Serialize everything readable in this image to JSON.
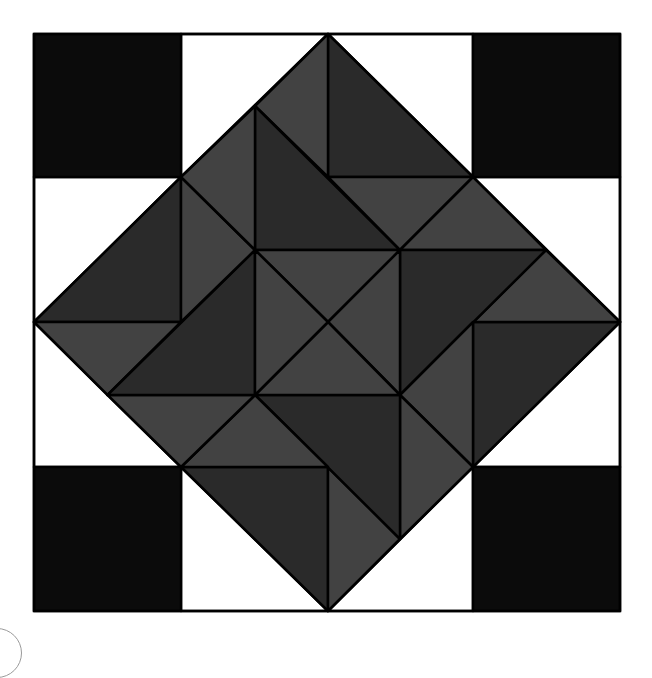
{
  "diagram": {
    "type": "quilt-block",
    "grid": {
      "half_units": 8,
      "x_lines_px": [
        34,
        107.5,
        181,
        255,
        328,
        400,
        473,
        546,
        620
      ],
      "y_lines_px": [
        34,
        106,
        177,
        250,
        322,
        395,
        467,
        539,
        611
      ]
    },
    "colors": {
      "background": "#ffffff",
      "corner_black": "#0b0b0b",
      "dark_gray": "#2a2a2a",
      "medium_gray": "#424242",
      "white": "#ffffff",
      "outline": "#000000"
    },
    "corner_squares": [
      {
        "name": "corner-square-top-left",
        "x0": 0,
        "y0": 0,
        "x1": 2,
        "y1": 2
      },
      {
        "name": "corner-square-top-right",
        "x0": 6,
        "y0": 0,
        "x1": 8,
        "y1": 2
      },
      {
        "name": "corner-square-bottom-left",
        "x0": 0,
        "y0": 6,
        "x1": 2,
        "y1": 8
      },
      {
        "name": "corner-square-bottom-right",
        "x0": 6,
        "y0": 6,
        "x1": 8,
        "y1": 8
      }
    ],
    "white_triangles": [
      {
        "name": "white-triangle-top-left",
        "points": [
          [
            2,
            0
          ],
          [
            4,
            0
          ],
          [
            2,
            2
          ]
        ]
      },
      {
        "name": "white-triangle-top-right",
        "points": [
          [
            4,
            0
          ],
          [
            6,
            0
          ],
          [
            6,
            2
          ]
        ]
      },
      {
        "name": "white-triangle-right-upper",
        "points": [
          [
            6,
            2
          ],
          [
            8,
            2
          ],
          [
            8,
            4
          ]
        ]
      },
      {
        "name": "white-triangle-right-lower",
        "points": [
          [
            8,
            4
          ],
          [
            8,
            6
          ],
          [
            6,
            6
          ]
        ]
      },
      {
        "name": "white-triangle-bottom-right",
        "points": [
          [
            6,
            6
          ],
          [
            6,
            8
          ],
          [
            4,
            8
          ]
        ]
      },
      {
        "name": "white-triangle-bottom-left",
        "points": [
          [
            4,
            8
          ],
          [
            2,
            8
          ],
          [
            2,
            6
          ]
        ]
      },
      {
        "name": "white-triangle-left-lower",
        "points": [
          [
            2,
            6
          ],
          [
            0,
            6
          ],
          [
            0,
            4
          ]
        ]
      },
      {
        "name": "white-triangle-left-upper",
        "points": [
          [
            0,
            4
          ],
          [
            0,
            2
          ],
          [
            2,
            2
          ]
        ]
      }
    ],
    "pinwheel_generator": [
      {
        "tone": "dark_gray",
        "points": [
          [
            4,
            0
          ],
          [
            4,
            2
          ],
          [
            6,
            2
          ]
        ]
      },
      {
        "tone": "medium_gray",
        "points": [
          [
            3,
            1
          ],
          [
            4,
            0
          ],
          [
            4,
            2
          ]
        ]
      },
      {
        "tone": "dark_gray",
        "points": [
          [
            3,
            1
          ],
          [
            3,
            3
          ],
          [
            5,
            3
          ]
        ]
      },
      {
        "tone": "medium_gray",
        "points": [
          [
            4,
            2
          ],
          [
            6,
            2
          ],
          [
            5,
            3
          ]
        ]
      },
      {
        "tone": "medium_gray",
        "points": [
          [
            6,
            2
          ],
          [
            5,
            3
          ],
          [
            7,
            3
          ]
        ]
      },
      {
        "tone": "medium_gray",
        "points": [
          [
            3,
            3
          ],
          [
            4,
            4
          ],
          [
            5,
            3
          ]
        ]
      }
    ],
    "rotations": 4
  }
}
